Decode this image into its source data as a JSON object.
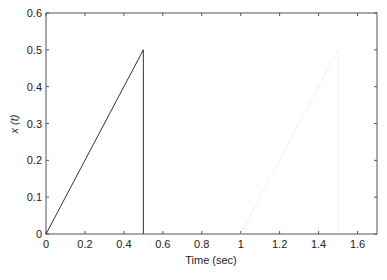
{
  "chart_data": {
    "type": "line",
    "title": "",
    "xlabel": "Time (sec)",
    "ylabel": "x (t)",
    "xlim": [
      0,
      1.7
    ],
    "ylim": [
      0,
      0.6
    ],
    "xticks": [
      0,
      0.2,
      0.4,
      0.6,
      0.8,
      1,
      1.2,
      1.4,
      1.6
    ],
    "xtick_labels": [
      "0",
      "0.2",
      "0.4",
      "0.6",
      "0.8",
      "1",
      "1.2",
      "1.4",
      "1.6"
    ],
    "yticks": [
      0,
      0.1,
      0.2,
      0.3,
      0.4,
      0.5,
      0.6
    ],
    "ytick_labels": [
      "0",
      "0.1",
      "0.2",
      "0.3",
      "0.4",
      "0.5",
      "0.6"
    ],
    "grid": false,
    "legend": null,
    "series": [
      {
        "name": "x(t) solid",
        "style": "solid",
        "color": "#333333",
        "x": [
          0,
          0.5,
          0.5
        ],
        "y": [
          0,
          0.5,
          0
        ]
      },
      {
        "name": "x(t) dotted",
        "style": "dotted",
        "color": "#d8d8d8",
        "x": [
          1.0,
          1.5,
          1.5
        ],
        "y": [
          0,
          0.5,
          0
        ]
      }
    ]
  }
}
